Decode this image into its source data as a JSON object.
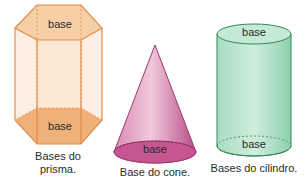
{
  "figures": {
    "prism": {
      "top_base_label": "base",
      "bottom_base_label": "base",
      "caption_line1": "Bases do",
      "caption_line2": "prisma.",
      "color": "#e8a56a"
    },
    "cone": {
      "base_label": "base",
      "caption": "Base do cone.",
      "color": "#c2508a"
    },
    "cylinder": {
      "top_base_label": "base",
      "bottom_base_label": "base",
      "caption": "Bases do cilindro.",
      "color": "#4aa878"
    }
  }
}
